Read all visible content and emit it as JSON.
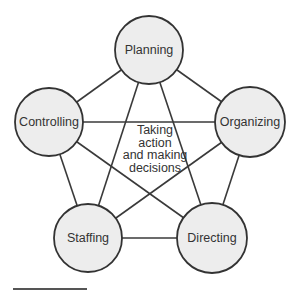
{
  "diagram": {
    "type": "complete-graph",
    "nodes": [
      {
        "id": "planning",
        "label": "Planning",
        "cx": 149,
        "cy": 50,
        "r": 34
      },
      {
        "id": "controlling",
        "label": "Controlling",
        "cx": 49,
        "cy": 122,
        "r": 34
      },
      {
        "id": "organizing",
        "label": "Organizing",
        "cx": 250,
        "cy": 122,
        "r": 35
      },
      {
        "id": "staffing",
        "label": "Staffing",
        "cx": 88,
        "cy": 238,
        "r": 34
      },
      {
        "id": "directing",
        "label": "Directing",
        "cx": 212,
        "cy": 238,
        "r": 35
      }
    ],
    "edges": [
      [
        "planning",
        "controlling"
      ],
      [
        "planning",
        "organizing"
      ],
      [
        "planning",
        "staffing"
      ],
      [
        "planning",
        "directing"
      ],
      [
        "controlling",
        "organizing"
      ],
      [
        "controlling",
        "staffing"
      ],
      [
        "controlling",
        "directing"
      ],
      [
        "organizing",
        "staffing"
      ],
      [
        "organizing",
        "directing"
      ],
      [
        "staffing",
        "directing"
      ]
    ],
    "center_label": {
      "lines": [
        "Taking",
        "action",
        "and making",
        "decisions"
      ]
    },
    "colors": {
      "node_fill": "#ededed",
      "node_stroke": "#333333",
      "edge": "#3a3a3a",
      "text": "#333333"
    }
  }
}
